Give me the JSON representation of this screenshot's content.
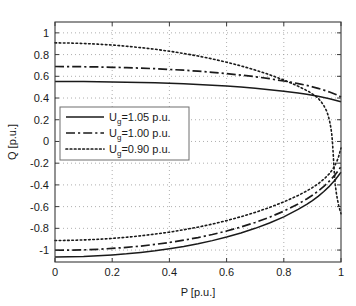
{
  "chart_data": {
    "type": "line",
    "title": "",
    "xlabel": "P [p.u.]",
    "ylabel": "Q [p.u.]",
    "xlim": [
      0,
      1
    ],
    "ylim": [
      -1.11,
      1.1
    ],
    "xticks": [
      "0",
      "0.2",
      "0.4",
      "0.6",
      "0.8",
      "1"
    ],
    "xtick_values": [
      0,
      0.2,
      0.4,
      0.6,
      0.8,
      1
    ],
    "yticks": [
      "1",
      "0.8",
      "0.6",
      "0.4",
      "0.2",
      "0",
      "-0.2",
      "-0.4",
      "-0.6",
      "-0.8",
      "-1"
    ],
    "ytick_values": [
      1,
      0.8,
      0.6,
      0.4,
      0.2,
      0,
      -0.2,
      -0.4,
      -0.6,
      -0.8,
      -1
    ],
    "grid": true,
    "grid_style": "dotted",
    "legend_position": "center-left",
    "series": [
      {
        "name": "U_g=1.05 p.u.",
        "label_base": "U",
        "label_sub": "g",
        "label_rest": "=1.05 p.u.",
        "style": "solid",
        "color": "#1a1a1a",
        "upper": [
          [
            0.0,
            0.552
          ],
          [
            0.05,
            0.552
          ],
          [
            0.1,
            0.551
          ],
          [
            0.15,
            0.55
          ],
          [
            0.2,
            0.548
          ],
          [
            0.25,
            0.546
          ],
          [
            0.3,
            0.543
          ],
          [
            0.35,
            0.54
          ],
          [
            0.4,
            0.536
          ],
          [
            0.45,
            0.531
          ],
          [
            0.5,
            0.525
          ],
          [
            0.55,
            0.518
          ],
          [
            0.6,
            0.51
          ],
          [
            0.65,
            0.501
          ],
          [
            0.7,
            0.49
          ],
          [
            0.75,
            0.477
          ],
          [
            0.8,
            0.463
          ],
          [
            0.85,
            0.446
          ],
          [
            0.88,
            0.434
          ],
          [
            0.9,
            0.425
          ],
          [
            0.92,
            0.416
          ],
          [
            0.94,
            0.405
          ],
          [
            0.96,
            0.393
          ],
          [
            0.98,
            0.38
          ],
          [
            1.0,
            0.365
          ]
        ],
        "lower": [
          [
            0.0,
            -1.063
          ],
          [
            0.05,
            -1.062
          ],
          [
            0.1,
            -1.059
          ],
          [
            0.15,
            -1.053
          ],
          [
            0.2,
            -1.045
          ],
          [
            0.25,
            -1.035
          ],
          [
            0.3,
            -1.022
          ],
          [
            0.35,
            -1.007
          ],
          [
            0.4,
            -0.988
          ],
          [
            0.45,
            -0.967
          ],
          [
            0.5,
            -0.942
          ],
          [
            0.55,
            -0.913
          ],
          [
            0.6,
            -0.88
          ],
          [
            0.65,
            -0.843
          ],
          [
            0.7,
            -0.8
          ],
          [
            0.75,
            -0.751
          ],
          [
            0.8,
            -0.694
          ],
          [
            0.85,
            -0.626
          ],
          [
            0.88,
            -0.579
          ],
          [
            0.9,
            -0.544
          ],
          [
            0.92,
            -0.505
          ],
          [
            0.94,
            -0.461
          ],
          [
            0.96,
            -0.411
          ],
          [
            0.98,
            -0.352
          ],
          [
            1.0,
            -0.283
          ]
        ]
      },
      {
        "name": "U_g=1.00 p.u.",
        "label_base": "U",
        "label_sub": "g",
        "label_rest": "=1.00 p.u.",
        "style": "dashdot",
        "color": "#1a1a1a",
        "upper": [
          [
            0.0,
            0.69
          ],
          [
            0.05,
            0.689
          ],
          [
            0.1,
            0.688
          ],
          [
            0.15,
            0.686
          ],
          [
            0.2,
            0.683
          ],
          [
            0.25,
            0.68
          ],
          [
            0.3,
            0.675
          ],
          [
            0.35,
            0.67
          ],
          [
            0.4,
            0.663
          ],
          [
            0.45,
            0.656
          ],
          [
            0.5,
            0.647
          ],
          [
            0.55,
            0.637
          ],
          [
            0.6,
            0.625
          ],
          [
            0.65,
            0.611
          ],
          [
            0.7,
            0.596
          ],
          [
            0.75,
            0.578
          ],
          [
            0.8,
            0.557
          ],
          [
            0.85,
            0.533
          ],
          [
            0.88,
            0.516
          ],
          [
            0.9,
            0.503
          ],
          [
            0.92,
            0.489
          ],
          [
            0.94,
            0.473
          ],
          [
            0.96,
            0.455
          ],
          [
            0.98,
            0.435
          ],
          [
            1.0,
            0.41
          ]
        ],
        "lower": [
          [
            0.0,
            -1.002
          ],
          [
            0.05,
            -1.001
          ],
          [
            0.1,
            -0.998
          ],
          [
            0.15,
            -0.993
          ],
          [
            0.2,
            -0.985
          ],
          [
            0.25,
            -0.975
          ],
          [
            0.3,
            -0.963
          ],
          [
            0.35,
            -0.948
          ],
          [
            0.4,
            -0.93
          ],
          [
            0.45,
            -0.909
          ],
          [
            0.5,
            -0.885
          ],
          [
            0.55,
            -0.857
          ],
          [
            0.6,
            -0.825
          ],
          [
            0.65,
            -0.788
          ],
          [
            0.7,
            -0.746
          ],
          [
            0.75,
            -0.698
          ],
          [
            0.8,
            -0.642
          ],
          [
            0.85,
            -0.576
          ],
          [
            0.88,
            -0.53
          ],
          [
            0.9,
            -0.496
          ],
          [
            0.92,
            -0.457
          ],
          [
            0.94,
            -0.414
          ],
          [
            0.96,
            -0.364
          ],
          [
            0.98,
            -0.305
          ],
          [
            1.0,
            -0.232
          ]
        ]
      },
      {
        "name": "U_g=0.90 p.u.",
        "label_base": "U",
        "label_sub": "g",
        "label_rest": "=0.90 p.u.",
        "style": "dotted",
        "color": "#1a1a1a",
        "upper": [
          [
            0.0,
            0.908
          ],
          [
            0.05,
            0.906
          ],
          [
            0.1,
            0.902
          ],
          [
            0.15,
            0.896
          ],
          [
            0.2,
            0.888
          ],
          [
            0.25,
            0.877
          ],
          [
            0.3,
            0.864
          ],
          [
            0.35,
            0.849
          ],
          [
            0.4,
            0.831
          ],
          [
            0.45,
            0.81
          ],
          [
            0.5,
            0.787
          ],
          [
            0.55,
            0.76
          ],
          [
            0.6,
            0.73
          ],
          [
            0.65,
            0.696
          ],
          [
            0.7,
            0.658
          ],
          [
            0.75,
            0.615
          ],
          [
            0.8,
            0.566
          ],
          [
            0.84,
            0.521
          ],
          [
            0.87,
            0.483
          ],
          [
            0.89,
            0.455
          ],
          [
            0.91,
            0.42
          ],
          [
            0.92,
            0.398
          ],
          [
            0.93,
            0.368
          ],
          [
            0.94,
            0.33
          ],
          [
            0.95,
            0.28
          ],
          [
            0.955,
            0.24
          ],
          [
            0.96,
            0.19
          ],
          [
            0.965,
            0.12
          ],
          [
            0.968,
            0.06
          ],
          [
            0.97,
            0.0
          ],
          [
            0.972,
            -0.08
          ],
          [
            0.974,
            -0.17
          ],
          [
            0.976,
            -0.26
          ],
          [
            0.978,
            -0.34
          ],
          [
            0.98,
            -0.4
          ],
          [
            0.984,
            -0.48
          ],
          [
            0.988,
            -0.54
          ],
          [
            0.992,
            -0.59
          ],
          [
            0.996,
            -0.63
          ],
          [
            1.0,
            -0.665
          ]
        ],
        "lower": [
          [
            0.0,
            -0.912
          ],
          [
            0.05,
            -0.911
          ],
          [
            0.1,
            -0.907
          ],
          [
            0.15,
            -0.901
          ],
          [
            0.2,
            -0.893
          ],
          [
            0.25,
            -0.882
          ],
          [
            0.3,
            -0.869
          ],
          [
            0.35,
            -0.853
          ],
          [
            0.4,
            -0.835
          ],
          [
            0.45,
            -0.813
          ],
          [
            0.5,
            -0.789
          ],
          [
            0.55,
            -0.761
          ],
          [
            0.6,
            -0.729
          ],
          [
            0.65,
            -0.693
          ],
          [
            0.7,
            -0.653
          ],
          [
            0.75,
            -0.608
          ],
          [
            0.8,
            -0.556
          ],
          [
            0.85,
            -0.497
          ],
          [
            0.88,
            -0.456
          ],
          [
            0.9,
            -0.425
          ],
          [
            0.92,
            -0.39
          ],
          [
            0.94,
            -0.348
          ],
          [
            0.96,
            -0.295
          ],
          [
            0.97,
            -0.26
          ],
          [
            0.98,
            -0.215
          ],
          [
            0.99,
            -0.155
          ],
          [
            1.0,
            -0.06
          ]
        ]
      }
    ]
  },
  "axes": {
    "xlabel": "P [p.u.]",
    "ylabel": "Q [p.u.]"
  },
  "legend": {
    "entries": [
      {
        "label": "U",
        "sub": "g",
        "rest": "=1.05 p.u.",
        "style": "solid"
      },
      {
        "label": "U",
        "sub": "g",
        "rest": "=1.00 p.u.",
        "style": "dashdot"
      },
      {
        "label": "U",
        "sub": "g",
        "rest": "=0.90 p.u.",
        "style": "dotted"
      }
    ]
  },
  "colors": {
    "line": "#1a1a1a",
    "grid": "#9a9a9a",
    "axis": "#3a3a3a",
    "background": "#ffffff",
    "legend_border": "#6f6f6f"
  }
}
